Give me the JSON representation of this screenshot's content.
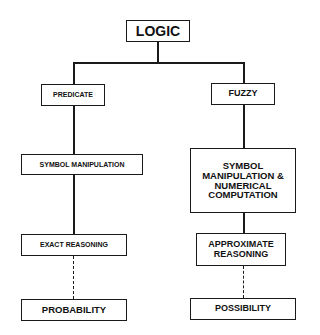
{
  "diagram": {
    "root": {
      "label": "LOGIC"
    },
    "branches": [
      {
        "label": "PREDICATE",
        "method": "SYMBOL MANIPULATION",
        "reasoning": "EXACT REASONING",
        "theory": "PROBABILITY"
      },
      {
        "label": "FUZZY",
        "method": "SYMBOL MANIPULATION & NUMERICAL COMPUTATION",
        "reasoning": "APPROXIMATE REASONING",
        "theory": "POSSIBILITY"
      }
    ],
    "connectors": {
      "solid": [
        "LOGIC-PREDICATE",
        "LOGIC-FUZZY",
        "PREDICATE-SYMBOL MANIPULATION",
        "SYMBOL MANIPULATION-EXACT REASONING",
        "FUZZY-SYMBOL MANIPULATION & NUMERICAL COMPUTATION",
        "SYMBOL MANIPULATION & NUMERICAL COMPUTATION-APPROXIMATE REASONING"
      ],
      "dashed": [
        "EXACT REASONING-PROBABILITY",
        "APPROXIMATE REASONING-POSSIBILITY"
      ]
    }
  }
}
